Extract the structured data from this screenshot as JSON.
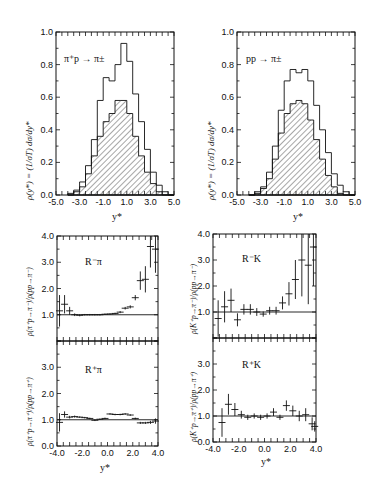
{
  "chart_data": [
    {
      "type": "area",
      "title": "π⁺p → π±",
      "xlabel": "y*",
      "ylabel": "ρ(y*) = (1/σT) dσ/dy*",
      "xlim": [
        -5.0,
        5.0
      ],
      "ylim": [
        0.0,
        1.0
      ],
      "xticks": [
        "-5.0",
        "-3.0",
        "-1.0",
        "1.0",
        "3.0",
        "5.0"
      ],
      "yticks": [
        "0.0",
        "0.2",
        "0.4",
        "0.6",
        "0.8",
        "1.0"
      ],
      "x": [
        -4.0,
        -3.5,
        -3.0,
        -2.5,
        -2.0,
        -1.5,
        -1.0,
        -0.5,
        0.0,
        0.5,
        1.0,
        1.5,
        2.0,
        2.5,
        3.0,
        3.5,
        4.0,
        4.5
      ],
      "series": [
        {
          "name": "outer (π±, unshaded)",
          "values": [
            0.01,
            0.03,
            0.08,
            0.18,
            0.34,
            0.58,
            0.72,
            0.7,
            0.8,
            0.93,
            0.82,
            0.62,
            0.45,
            0.28,
            0.14,
            0.06,
            0.02,
            0.0
          ]
        },
        {
          "name": "inner (hatched)",
          "values": [
            0.0,
            0.02,
            0.05,
            0.13,
            0.24,
            0.36,
            0.45,
            0.5,
            0.58,
            0.58,
            0.5,
            0.36,
            0.24,
            0.14,
            0.07,
            0.02,
            0.0,
            0.0
          ]
        }
      ]
    },
    {
      "type": "area",
      "title": "pp → π±",
      "xlabel": "y*",
      "ylabel": "ρ(y*) = (1/σT) dσ/dy*",
      "xlim": [
        -5.0,
        5.0
      ],
      "ylim": [
        0.0,
        1.0
      ],
      "xticks": [
        "-5.0",
        "-3.0",
        "-1.0",
        "1.0",
        "3.0",
        "5.0"
      ],
      "yticks": [
        "0.0",
        "0.2",
        "0.4",
        "0.6",
        "0.8",
        "1.0"
      ],
      "x": [
        -4.0,
        -3.5,
        -3.0,
        -2.5,
        -2.0,
        -1.5,
        -1.0,
        -0.5,
        0.0,
        0.5,
        1.0,
        1.5,
        2.0,
        2.5,
        3.0,
        3.5,
        4.0,
        4.5
      ],
      "series": [
        {
          "name": "outer (π±, unshaded)",
          "values": [
            0.0,
            0.02,
            0.05,
            0.14,
            0.3,
            0.52,
            0.7,
            0.77,
            0.75,
            0.77,
            0.7,
            0.55,
            0.4,
            0.26,
            0.13,
            0.06,
            0.02,
            0.0
          ]
        },
        {
          "name": "inner (hatched)",
          "values": [
            0.0,
            0.01,
            0.04,
            0.1,
            0.22,
            0.38,
            0.5,
            0.56,
            0.58,
            0.56,
            0.46,
            0.34,
            0.22,
            0.12,
            0.05,
            0.01,
            0.0,
            0.0
          ]
        }
      ]
    },
    {
      "type": "scatter",
      "title": "R⁻π",
      "xlabel": "y*",
      "ylabel": "ρ(π⁺p→π⁻)/ρ(pp→π⁻)",
      "xlim": [
        -4.0,
        4.0
      ],
      "ylim": [
        0.0,
        4.0
      ],
      "yticks": [
        "1.0",
        "2.0",
        "3.0",
        "4.0"
      ],
      "reference_line": 1.0,
      "x": [
        -3.8,
        -3.4,
        -3.0,
        -2.6,
        -2.2,
        -1.8,
        -1.4,
        -1.0,
        -0.6,
        -0.2,
        0.2,
        0.6,
        1.0,
        1.4,
        1.8,
        2.2,
        2.6,
        3.0,
        3.4,
        3.8
      ],
      "values": [
        1.15,
        1.4,
        1.15,
        1.0,
        0.98,
        1.0,
        1.0,
        1.0,
        1.0,
        1.02,
        1.03,
        1.05,
        1.1,
        1.25,
        1.3,
        1.65,
        2.3,
        2.35,
        3.6,
        3.5
      ],
      "errors": [
        0.6,
        0.35,
        0.15,
        0.05,
        0.04,
        0.03,
        0.03,
        0.03,
        0.03,
        0.03,
        0.03,
        0.03,
        0.04,
        0.05,
        0.06,
        0.1,
        0.35,
        0.5,
        0.8,
        0.9
      ]
    },
    {
      "type": "scatter",
      "title": "R⁺π",
      "xlabel": "y*",
      "ylabel": "ρ(π⁺p→π⁺)/ρ(pp→π⁺)",
      "xlim": [
        -4.0,
        4.0
      ],
      "ylim": [
        0.0,
        4.0
      ],
      "xticks": [
        "-4.0",
        "-2.0",
        "0.0",
        "2.0",
        "4.0"
      ],
      "yticks": [
        "0.0",
        "1.0",
        "2.0",
        "3.0"
      ],
      "reference_line": 1.0,
      "x": [
        -3.8,
        -3.4,
        -3.0,
        -2.6,
        -2.2,
        -1.8,
        -1.4,
        -1.0,
        -0.6,
        -0.2,
        0.2,
        0.6,
        1.0,
        1.4,
        1.8,
        2.2,
        2.6,
        3.0,
        3.4,
        3.8
      ],
      "values": [
        0.9,
        1.2,
        1.1,
        1.12,
        1.1,
        1.08,
        1.05,
        0.98,
        1.02,
        1.05,
        1.22,
        1.2,
        1.2,
        1.22,
        1.18,
        1.05,
        0.88,
        0.88,
        0.9,
        0.95
      ],
      "errors": [
        0.35,
        0.12,
        0.05,
        0.04,
        0.03,
        0.03,
        0.03,
        0.03,
        0.03,
        0.03,
        0.03,
        0.03,
        0.03,
        0.03,
        0.03,
        0.03,
        0.04,
        0.04,
        0.06,
        0.1
      ]
    },
    {
      "type": "scatter",
      "title": "R⁻K",
      "xlabel": "y*",
      "ylabel": "ρ(K⁺p→π⁻)/ρ(pp→π⁻)",
      "xlim": [
        -4.0,
        4.0
      ],
      "ylim": [
        0.0,
        4.0
      ],
      "yticks": [
        "1.0",
        "2.0",
        "3.0",
        "4.0"
      ],
      "reference_line": 1.0,
      "x": [
        -3.6,
        -3.1,
        -2.6,
        -2.1,
        -1.6,
        -1.1,
        -0.6,
        -0.1,
        0.4,
        0.9,
        1.4,
        1.9,
        2.4,
        2.9,
        3.4,
        3.8
      ],
      "values": [
        0.75,
        1.2,
        1.45,
        0.7,
        1.1,
        1.1,
        1.0,
        0.92,
        1.05,
        1.05,
        1.35,
        1.7,
        2.25,
        3.0,
        2.8,
        3.5
      ],
      "errors": [
        0.7,
        0.6,
        0.45,
        0.25,
        0.2,
        0.2,
        0.15,
        0.1,
        0.15,
        0.15,
        0.25,
        0.45,
        0.75,
        1.4,
        1.5,
        1.5
      ]
    },
    {
      "type": "scatter",
      "title": "R⁺K",
      "xlabel": "y*",
      "ylabel": "ρ(K⁺p→π⁺)/ρ(pp→π⁺)",
      "xlim": [
        -4.0,
        4.0
      ],
      "ylim": [
        0.0,
        4.0
      ],
      "xticks": [
        "-4.0",
        "-2.0",
        "0.0",
        "2.0",
        "4.0"
      ],
      "yticks": [
        "0.0",
        "1.0",
        "2.0",
        "3.0"
      ],
      "reference_line": 1.0,
      "x": [
        -3.3,
        -2.8,
        -2.3,
        -1.8,
        -1.3,
        -0.8,
        -0.3,
        0.2,
        0.7,
        1.2,
        1.7,
        2.2,
        2.7,
        3.2,
        3.7,
        3.9
      ],
      "values": [
        0.75,
        1.45,
        1.25,
        1.05,
        0.95,
        1.0,
        0.95,
        1.0,
        1.15,
        0.95,
        1.4,
        1.2,
        1.0,
        1.05,
        0.7,
        0.6
      ],
      "errors": [
        0.55,
        0.4,
        0.25,
        0.15,
        0.1,
        0.1,
        0.1,
        0.1,
        0.15,
        0.1,
        0.2,
        0.2,
        0.2,
        0.25,
        0.25,
        0.2
      ]
    }
  ],
  "labels": {
    "tl_title": "π⁺p → π±",
    "tr_title": "pp → π±",
    "tl_ylabel": "ρ(y*) = (1/σT) dσ/dy*",
    "tr_ylabel": "ρ(y*) = (1/σT) dσ/dy*",
    "top_xlabel": "y*",
    "bl_xlabel": "y*",
    "br_xlabel": "y*",
    "r_pi_minus": "R⁻π",
    "r_pi_plus": "R⁺π",
    "r_k_minus": "R⁻K",
    "r_k_plus": "R⁺K",
    "bl_ylabel_top": "ρ(π⁺p→π⁻)/ρ(pp→π⁻)",
    "bl_ylabel_bot": "ρ(π⁺p→π⁺)/ρ(pp→π⁺)",
    "br_ylabel_top": "ρ(K⁺p→π⁻)/ρ(pp→π⁻)",
    "br_ylabel_bot": "ρ(K⁺p→π⁺)/ρ(pp→π⁺)"
  }
}
